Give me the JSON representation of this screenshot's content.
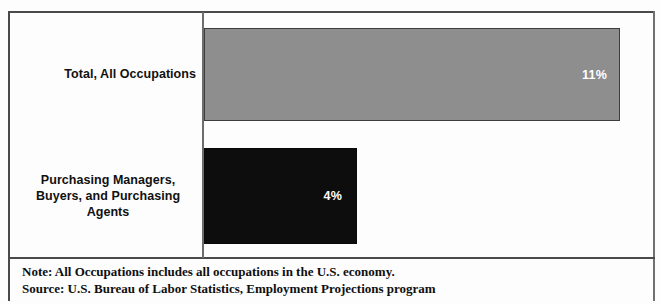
{
  "chart_data": {
    "type": "bar",
    "orientation": "horizontal",
    "title": "",
    "subtitle": "",
    "xlabel": "",
    "ylabel": "",
    "categories": [
      "Total, All Occupations",
      "Purchasing Managers, Buyers, and Purchasing Agents"
    ],
    "values": [
      11,
      4
    ],
    "value_labels": [
      "11%",
      "4%"
    ],
    "xlim": [
      0,
      13
    ],
    "grid": false,
    "legend": null,
    "series": [
      {
        "name": "Percent change",
        "values": [
          11,
          4
        ],
        "colors": [
          "#8e8e8e",
          "#0d0d0d"
        ]
      }
    ],
    "annotations": [
      "Note: All Occupations includes all occupations in the U.S. economy.",
      "Source: U.S. Bureau of Labor Statistics, Employment Projections program"
    ]
  },
  "bars": [
    {
      "category_line_1": "Total, All Occupations",
      "value_label": "11%",
      "color": "#8e8e8e"
    },
    {
      "category_line_1": "Purchasing Managers,",
      "category_line_2": "Buyers, and Purchasing",
      "category_line_3": "Agents",
      "value_label": "4%",
      "color": "#0d0d0d"
    }
  ],
  "footer": {
    "note": "Note: All Occupations includes all occupations in the U.S. economy.",
    "source": "Source: U.S. Bureau of Labor Statistics, Employment Projections program"
  },
  "colors": {
    "bar_total": "#8e8e8e",
    "bar_purchasing": "#0d0d0d",
    "frame": "#4a4a4a",
    "axis": "#6d6d6d",
    "value_text": "#ffffff",
    "label_text": "#111111",
    "background": "#ffffff"
  }
}
